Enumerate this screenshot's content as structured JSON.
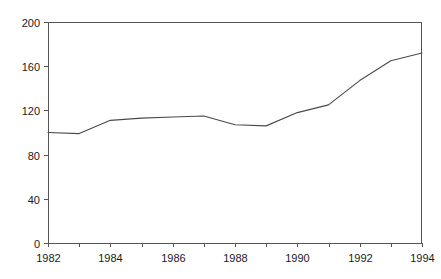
{
  "chart_data": {
    "type": "line",
    "title": "",
    "subtitle": "",
    "xlabel": "",
    "ylabel": "",
    "x": [
      1982,
      1983,
      1984,
      1985,
      1986,
      1987,
      1988,
      1989,
      1990,
      1991,
      1992,
      1993,
      1994
    ],
    "series": [
      {
        "name": "series-1",
        "values": [
          100,
          99,
          111,
          113,
          114,
          115,
          107,
          106,
          118,
          125,
          147,
          165,
          172
        ],
        "color": "#4a4a4a"
      }
    ],
    "xlim": [
      1982,
      1994
    ],
    "ylim": [
      0,
      200
    ],
    "y_ticks": [
      0,
      40,
      80,
      120,
      160,
      200
    ],
    "y_tick_labels": [
      "0",
      "40",
      "80",
      "120",
      "160",
      "200"
    ],
    "x_ticks": [
      1982,
      1983,
      1984,
      1985,
      1986,
      1987,
      1988,
      1989,
      1990,
      1991,
      1992,
      1993,
      1994
    ],
    "x_tick_labels": [
      "1982",
      "",
      "1984",
      "",
      "1986",
      "",
      "1988",
      "",
      "1990",
      "",
      "1992",
      "",
      "1994"
    ],
    "x_labeled_ticks": [
      1982,
      1984,
      1986,
      1988,
      1990,
      1992,
      1994
    ],
    "grid": false,
    "legend": false,
    "legend_position": "none",
    "markers": false,
    "annotations": [],
    "axis_color": "#555555",
    "background_color": "#ffffff",
    "frame": {
      "top": true,
      "right": true,
      "bottom": true,
      "left": true
    }
  },
  "layout": {
    "plot_left": 48,
    "plot_right": 422,
    "plot_top": 22,
    "plot_bottom": 243
  }
}
